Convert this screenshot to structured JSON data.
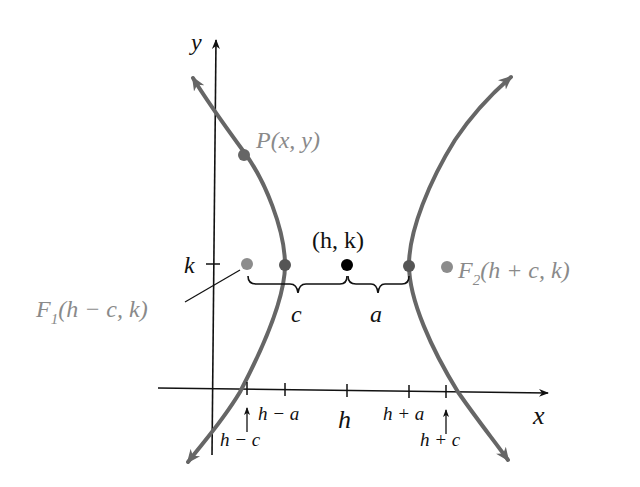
{
  "diagram": {
    "type": "hyperbola-horizontal-transverse-axis",
    "colors": {
      "curve": "#666666",
      "axes": "#111111",
      "focus": "#8c8c8c",
      "vertex": "#555555",
      "center": "#000000",
      "focus_label": "#8a8a8a",
      "point_label": "#8a8a8a"
    },
    "axes": {
      "x_label": "x",
      "y_label": "y"
    },
    "y_axis_tick": "k",
    "points": {
      "P": {
        "label": "P(x, y)"
      },
      "center": {
        "label": "(h, k)"
      },
      "F1": {
        "name": "F",
        "sub": "1",
        "rest": "(h − c, k)"
      },
      "F2": {
        "name": "F",
        "sub": "2",
        "rest": "(h + c, k)"
      }
    },
    "braces": {
      "left": "c",
      "right": "a"
    },
    "x_axis_ticks": [
      {
        "label": "h − c",
        "arrow": true
      },
      {
        "label": "h − a",
        "arrow": false
      },
      {
        "label": "h",
        "arrow": false
      },
      {
        "label": "h + a",
        "arrow": false
      },
      {
        "label": "h + c",
        "arrow": true
      }
    ]
  }
}
